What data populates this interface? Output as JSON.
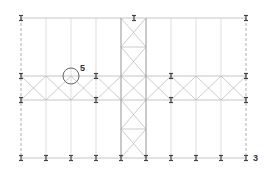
{
  "diagram": {
    "type": "structural-floor-plan",
    "columns_x": [
      21,
      46,
      71,
      96,
      121,
      146,
      171,
      196,
      221,
      246
    ],
    "rows": {
      "top": 18,
      "band_top": 76,
      "band_bottom": 100,
      "bottom": 158
    },
    "tower": {
      "x_left": 121,
      "x_right": 146,
      "y_mid_top": 47,
      "y_mid_bottom": 129
    },
    "top_ibeams_x": [
      21,
      134,
      246
    ],
    "band_ibeams_x": [
      21,
      96,
      171,
      246
    ],
    "bottom_ibeams_x": [
      21,
      46,
      71,
      96,
      121,
      146,
      171,
      196,
      221,
      246
    ],
    "marker": {
      "cx": 71,
      "cy": 76,
      "r": 8,
      "label": "5"
    },
    "labels": {
      "detail_ref": "5",
      "grid_ref": "3"
    },
    "colors": {
      "line": "#b5b5b5",
      "beam": "#444444",
      "dash": "#9a9a9a"
    }
  }
}
